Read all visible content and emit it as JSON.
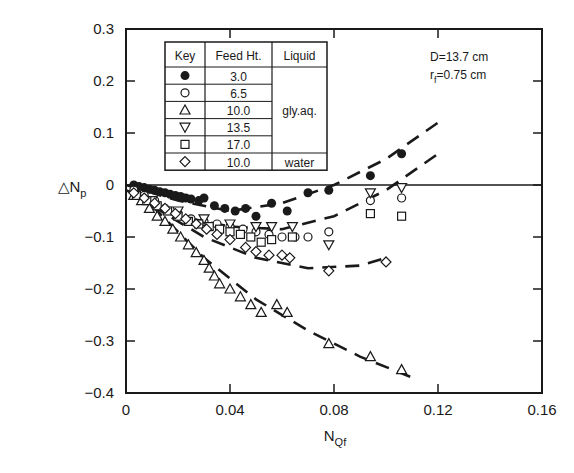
{
  "chart_data": {
    "type": "scatter",
    "title": "",
    "xlabel": "N_Qf",
    "ylabel": "ΔN_p",
    "xlim": [
      0,
      0.16
    ],
    "ylim": [
      -0.4,
      0.3
    ],
    "xticks": [
      "0",
      "0.04",
      "0.08",
      "0.12",
      "0.16"
    ],
    "yticks": [
      "0.3",
      "0.2",
      "0.1",
      "0",
      "-0.1",
      "-0.2",
      "-0.3",
      "-0.4"
    ],
    "grid": false,
    "annotations": [
      "D=13.7 cm",
      "r_f=0.75 cm"
    ],
    "legend": {
      "position": "upper-left",
      "headers": [
        "Key",
        "Feed Ht.",
        "Liquid"
      ],
      "rows": [
        {
          "marker": "filled-circle",
          "feed_ht": "3.0",
          "liquid": "gly.aq."
        },
        {
          "marker": "open-circle",
          "feed_ht": "6.5",
          "liquid": "gly.aq."
        },
        {
          "marker": "triangle-up",
          "feed_ht": "10.0",
          "liquid": "gly.aq."
        },
        {
          "marker": "triangle-down",
          "feed_ht": "13.5",
          "liquid": "gly.aq."
        },
        {
          "marker": "square",
          "feed_ht": "17.0",
          "liquid": "gly.aq."
        },
        {
          "marker": "diamond",
          "feed_ht": "10.0",
          "liquid": "water"
        }
      ]
    },
    "series": [
      {
        "name": "3.0 gly.aq.",
        "marker": "filled-circle",
        "x": [
          0.003,
          0.005,
          0.007,
          0.009,
          0.011,
          0.013,
          0.015,
          0.017,
          0.019,
          0.021,
          0.023,
          0.025,
          0.028,
          0.03,
          0.034,
          0.038,
          0.042,
          0.046,
          0.05,
          0.056,
          0.062,
          0.07,
          0.078,
          0.094,
          0.106
        ],
        "y": [
          0.0,
          -0.003,
          -0.005,
          -0.008,
          -0.01,
          -0.013,
          -0.015,
          -0.018,
          -0.02,
          -0.022,
          -0.025,
          -0.027,
          -0.03,
          -0.025,
          -0.04,
          -0.045,
          -0.05,
          -0.045,
          -0.06,
          -0.035,
          -0.05,
          -0.015,
          -0.01,
          0.018,
          0.06
        ]
      },
      {
        "name": "6.5 gly.aq.",
        "marker": "open-circle",
        "x": [
          0.003,
          0.007,
          0.011,
          0.015,
          0.02,
          0.025,
          0.03,
          0.035,
          0.04,
          0.045,
          0.05,
          0.055,
          0.06,
          0.065,
          0.07,
          0.078,
          0.094,
          0.106
        ],
        "y": [
          -0.01,
          -0.02,
          -0.03,
          -0.045,
          -0.055,
          -0.065,
          -0.07,
          -0.075,
          -0.08,
          -0.085,
          -0.09,
          -0.095,
          -0.1,
          -0.1,
          -0.1,
          -0.09,
          -0.03,
          -0.025
        ]
      },
      {
        "name": "10.0 gly.aq.",
        "marker": "triangle-up",
        "x": [
          0.003,
          0.006,
          0.009,
          0.012,
          0.015,
          0.018,
          0.021,
          0.024,
          0.027,
          0.03,
          0.032,
          0.034,
          0.036,
          0.04,
          0.044,
          0.048,
          0.052,
          0.058,
          0.062,
          0.078,
          0.094,
          0.106
        ],
        "y": [
          -0.02,
          -0.03,
          -0.045,
          -0.06,
          -0.07,
          -0.085,
          -0.1,
          -0.115,
          -0.13,
          -0.145,
          -0.16,
          -0.175,
          -0.19,
          -0.2,
          -0.215,
          -0.23,
          -0.245,
          -0.23,
          -0.245,
          -0.305,
          -0.33,
          -0.355
        ]
      },
      {
        "name": "13.5 gly.aq.",
        "marker": "triangle-down",
        "x": [
          0.01,
          0.02,
          0.03,
          0.04,
          0.05,
          0.056,
          0.064,
          0.078,
          0.094,
          0.106
        ],
        "y": [
          -0.03,
          -0.05,
          -0.065,
          -0.075,
          -0.08,
          -0.08,
          -0.08,
          -0.115,
          -0.015,
          -0.005
        ]
      },
      {
        "name": "17.0 gly.aq.",
        "marker": "square",
        "x": [
          0.004,
          0.008,
          0.012,
          0.016,
          0.02,
          0.024,
          0.028,
          0.032,
          0.036,
          0.04,
          0.044,
          0.048,
          0.052,
          0.056,
          0.064,
          0.094,
          0.106
        ],
        "y": [
          -0.02,
          -0.03,
          -0.04,
          -0.05,
          -0.06,
          -0.07,
          -0.075,
          -0.08,
          -0.085,
          -0.09,
          -0.095,
          -0.1,
          -0.11,
          -0.105,
          -0.1,
          -0.055,
          -0.06
        ]
      },
      {
        "name": "10.0 water",
        "marker": "diamond",
        "x": [
          0.003,
          0.007,
          0.011,
          0.015,
          0.019,
          0.023,
          0.027,
          0.031,
          0.035,
          0.04,
          0.046,
          0.05,
          0.055,
          0.06,
          0.063,
          0.078,
          0.1
        ],
        "y": [
          -0.015,
          -0.025,
          -0.035,
          -0.045,
          -0.055,
          -0.065,
          -0.075,
          -0.085,
          -0.095,
          -0.105,
          -0.12,
          -0.128,
          -0.135,
          -0.135,
          -0.14,
          -0.165,
          -0.148
        ]
      }
    ],
    "fit_curves": [
      {
        "name": "3.0 fit",
        "style": "dashed",
        "x": [
          0.0,
          0.02,
          0.04,
          0.06,
          0.08,
          0.1,
          0.12
        ],
        "y": [
          0.0,
          -0.03,
          -0.05,
          -0.035,
          0.0,
          0.05,
          0.12
        ]
      },
      {
        "name": "6.5-17.0 fit",
        "style": "dashed",
        "x": [
          0.0,
          0.02,
          0.04,
          0.06,
          0.08,
          0.1,
          0.12
        ],
        "y": [
          -0.01,
          -0.06,
          -0.08,
          -0.085,
          -0.06,
          -0.01,
          0.06
        ]
      },
      {
        "name": "water fit",
        "style": "dashed",
        "x": [
          0.01,
          0.03,
          0.05,
          0.07,
          0.09,
          0.1
        ],
        "y": [
          -0.04,
          -0.1,
          -0.14,
          -0.16,
          -0.155,
          -0.14
        ]
      },
      {
        "name": "10.0 gly.aq. fit",
        "style": "dashed",
        "x": [
          0.01,
          0.03,
          0.05,
          0.07,
          0.09,
          0.11
        ],
        "y": [
          -0.04,
          -0.14,
          -0.22,
          -0.28,
          -0.33,
          -0.37
        ]
      }
    ]
  }
}
